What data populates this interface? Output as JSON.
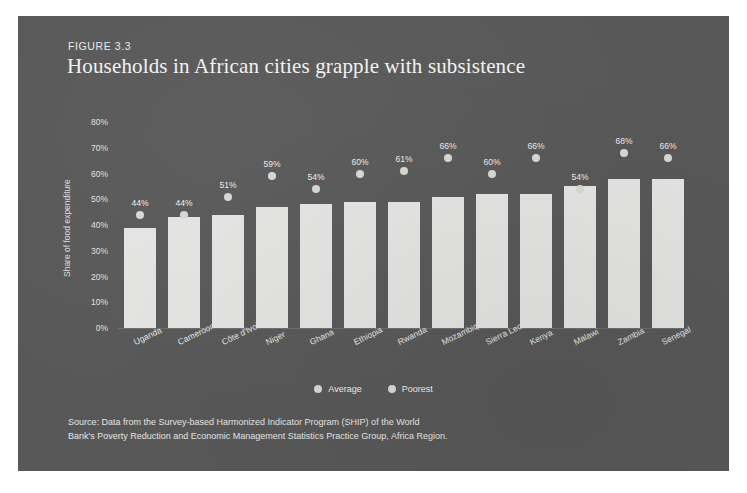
{
  "figure": {
    "label": "FIGURE 3.3",
    "title": "Households in African cities grapple with subsistence"
  },
  "legend": {
    "items": [
      {
        "label": "Average",
        "marker": "circle-icon",
        "color": "#d7d7d4"
      },
      {
        "label": "Poorest",
        "marker": "circle-icon",
        "color": "#d7d7d4"
      }
    ]
  },
  "source": {
    "line1": "Source: Data from the Survey-based Harmonized Indicator Program (SHIP) of the World",
    "line2": "Bank's Poverty Reduction and Economic Management Statistics Practice Group, Africa Region."
  },
  "colors": {
    "panel_background": "#585858",
    "bar": "#e4e4e2",
    "dot": "#d7d7d4",
    "text": "#ededeb",
    "page_background": "#ffffff"
  },
  "chart_data": {
    "type": "bar",
    "title": "Households in African cities grapple with subsistence",
    "xlabel": "",
    "ylabel": "Share of food expenditure",
    "ylim": [
      0,
      80
    ],
    "ytick_labels": [
      "0%",
      "10%",
      "20%",
      "30%",
      "40%",
      "50%",
      "60%",
      "70%",
      "80%"
    ],
    "ytick_values": [
      0,
      10,
      20,
      30,
      40,
      50,
      60,
      70,
      80
    ],
    "grid": false,
    "legend_position": "bottom-center",
    "categories": [
      "Uganda",
      "Cameroon",
      "Côte d'Ivoire",
      "Niger",
      "Ghana",
      "Ethiopia",
      "Rwanda",
      "Mozambique",
      "Sierra Leon",
      "Kenya",
      "Malawi",
      "Zambia",
      "Senegal"
    ],
    "series": [
      {
        "name": "Average",
        "type": "bar",
        "values": [
          39,
          43,
          44,
          47,
          48,
          49,
          49,
          51,
          52,
          52,
          55,
          58,
          58
        ]
      },
      {
        "name": "Poorest",
        "type": "scatter",
        "values": [
          44,
          44,
          51,
          59,
          54,
          60,
          61,
          66,
          60,
          66,
          54,
          68,
          66
        ],
        "labels": [
          "44%",
          "44%",
          "51%",
          "59%",
          "54%",
          "60%",
          "61%",
          "66%",
          "60%",
          "66%",
          "54%",
          "68%",
          "66%"
        ]
      }
    ]
  }
}
